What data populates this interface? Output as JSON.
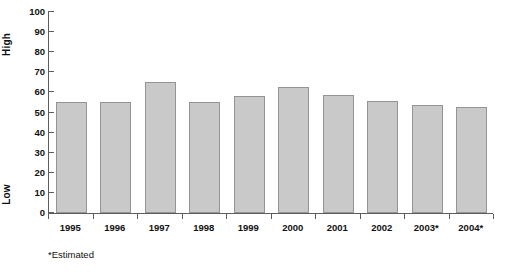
{
  "chart_data": {
    "type": "bar",
    "title": "",
    "xlabel": "",
    "ylabel": "",
    "categories": [
      "1995",
      "1996",
      "1997",
      "1998",
      "1999",
      "2000",
      "2001",
      "2002",
      "2003*",
      "2004*"
    ],
    "values": [
      55,
      55,
      65,
      55,
      58,
      62.5,
      58.5,
      55.5,
      53.5,
      52.5
    ],
    "ylim": [
      0,
      100
    ],
    "ytick_labels": [
      "100",
      "90",
      "80",
      "70",
      "60",
      "50",
      "40",
      "30",
      "20",
      "10",
      "0"
    ],
    "ytick_values": [
      100,
      90,
      80,
      70,
      60,
      50,
      40,
      30,
      20,
      10,
      0
    ],
    "grid": false,
    "legend": "none",
    "axis_captions": {
      "high": "High",
      "low": "Low"
    },
    "footnote": "*Estimated",
    "colors": {
      "bar_fill": "#c9c9c9",
      "bar_border": "#949494",
      "axis": "#5d5d5d",
      "text": "#111111",
      "background": "#ffffff"
    }
  }
}
